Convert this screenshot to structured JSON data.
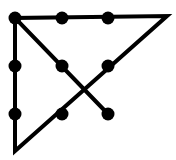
{
  "diagram": {
    "title": "",
    "stroke_color": "#000000",
    "background": "#ffffff",
    "dots": [
      {
        "x": 15,
        "y": 18
      },
      {
        "x": 62,
        "y": 18
      },
      {
        "x": 108,
        "y": 18
      },
      {
        "x": 15,
        "y": 66
      },
      {
        "x": 62,
        "y": 66
      },
      {
        "x": 108,
        "y": 66
      },
      {
        "x": 15,
        "y": 114
      },
      {
        "x": 62,
        "y": 114
      },
      {
        "x": 108,
        "y": 114
      }
    ],
    "path": [
      {
        "x": 108,
        "y": 114
      },
      {
        "x": 15,
        "y": 18
      },
      {
        "x": 167,
        "y": 16
      },
      {
        "x": 15,
        "y": 151
      },
      {
        "x": 15,
        "y": 18
      }
    ]
  }
}
